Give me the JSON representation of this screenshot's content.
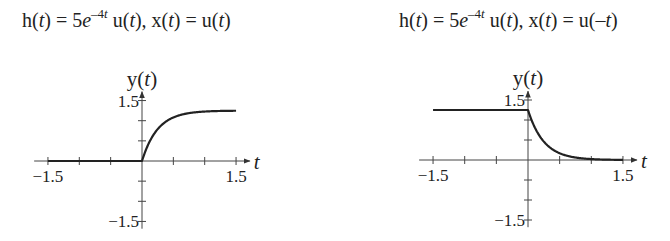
{
  "charts": [
    {
      "title": {
        "h": "h(t) = 5e^{-4t} u(t)",
        "x": "x(t) = u(t)"
      },
      "ylabel": "y(t)",
      "xlabel": "t",
      "xtick_labels": [
        "-1.5",
        "1.5"
      ],
      "ytick_labels": [
        "1.5",
        "-1.5"
      ]
    },
    {
      "title": {
        "h": "h(t) = 5e^{-4t} u(t)",
        "x": "x(t) = u(-t)"
      },
      "ylabel": "y(t)",
      "xlabel": "t",
      "xtick_labels": [
        "-1.5",
        "1.5"
      ],
      "ytick_labels": [
        "1.5",
        "-1.5"
      ]
    }
  ],
  "chart_data": [
    {
      "type": "line",
      "title": "h(t) = 5e^{-4t} u(t), x(t) = u(t)",
      "xlabel": "t",
      "ylabel": "y(t)",
      "xlim": [
        -1.5,
        1.5
      ],
      "ylim": [
        -1.5,
        1.5
      ],
      "xticks": [
        -1.5,
        -1.0,
        -0.5,
        0,
        0.5,
        1.0,
        1.5
      ],
      "yticks": [
        -1.5,
        -1.0,
        -0.5,
        0,
        0.5,
        1.0,
        1.5
      ],
      "grid": false,
      "formula": "y(t) = 1.25(1 - e^{-4t}) u(t)",
      "x": [
        -1.5,
        -1.0,
        -0.5,
        0,
        0.1,
        0.2,
        0.3,
        0.5,
        0.75,
        1.0,
        1.25,
        1.5
      ],
      "y": [
        0,
        0,
        0,
        0,
        0.41,
        0.69,
        0.87,
        1.08,
        1.19,
        1.23,
        1.24,
        1.25
      ]
    },
    {
      "type": "line",
      "title": "h(t) = 5e^{-4t} u(t), x(t) = u(-t)",
      "xlabel": "t",
      "ylabel": "y(t)",
      "xlim": [
        -1.5,
        1.5
      ],
      "ylim": [
        -1.5,
        1.5
      ],
      "xticks": [
        -1.5,
        -1.0,
        -0.5,
        0,
        0.5,
        1.0,
        1.5
      ],
      "yticks": [
        -1.5,
        -1.0,
        -0.5,
        0,
        0.5,
        1.0,
        1.5
      ],
      "grid": false,
      "formula": "y(t) = 1.25 for t<0; 1.25 e^{-4t} for t>=0",
      "x": [
        -1.5,
        -1.0,
        -0.5,
        0,
        0.1,
        0.2,
        0.3,
        0.5,
        0.75,
        1.0,
        1.25,
        1.5
      ],
      "y": [
        1.25,
        1.25,
        1.25,
        1.25,
        0.84,
        0.56,
        0.38,
        0.17,
        0.06,
        0.02,
        0.01,
        0.0
      ]
    }
  ]
}
